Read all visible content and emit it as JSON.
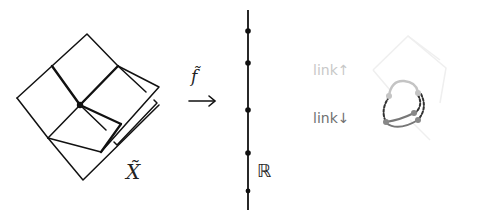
{
  "diagram": {
    "title": "",
    "left_figure": {
      "label": "X̃",
      "description": "square complex drawn as tilted grid with extra sheet and bracket"
    },
    "map": {
      "label": "f̃",
      "arrow": "→"
    },
    "real_line": {
      "label": "ℝ",
      "dots_y": [
        31,
        63,
        110,
        153,
        191
      ]
    },
    "links": {
      "up_label": "link↑",
      "down_label": "link↓"
    },
    "colors": {
      "ink": "#111111",
      "link_up": "#c8c8c8",
      "link_down": "#707070",
      "faint": "#eeeeee"
    }
  }
}
